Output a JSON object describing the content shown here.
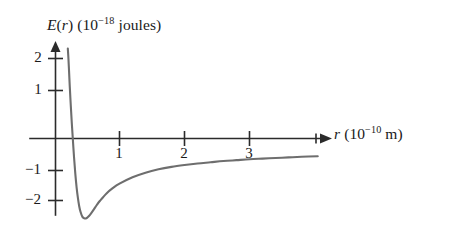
{
  "figure": {
    "kind": "line-plot",
    "background_color": "#ffffff",
    "axis_color": "#2b2b2b",
    "curve_color": "#6e6e6e"
  },
  "labels": {
    "y_axis": {
      "quantity": "E(r)",
      "quantity_base": "E",
      "quantity_arg": "(r)",
      "units_open": "(10",
      "units_exponent": "−18",
      "units_close": " joules)",
      "full_text": "E(r) (10−18 joules)"
    },
    "x_axis": {
      "quantity": "r",
      "units_open": "(10",
      "units_exponent": "−10",
      "units_close": " m)",
      "full_text": "r (10−10 m)"
    }
  },
  "chart_data": {
    "type": "line",
    "title": "",
    "subtitle": "",
    "xlabel": "r (10−10 m)",
    "ylabel": "E(r) (10−18 joules)",
    "xlim": [
      -0.4,
      4.3
    ],
    "ylim": [
      -2.9,
      2.6
    ],
    "grid": false,
    "legend": null,
    "x_ticks": [
      1,
      2,
      3
    ],
    "x_tick_labels": [
      "1",
      "2",
      "3"
    ],
    "y_ticks": [
      2,
      1,
      -1,
      -2
    ],
    "y_tick_labels": [
      "2",
      "1",
      "−1",
      "−2"
    ],
    "x_axis_arrow": true,
    "y_axis_arrow": true,
    "annotations": [
      {
        "text": "minimum of potential well",
        "x": 0.48,
        "y": -2.62
      },
      {
        "text": "zero crossing",
        "x": 0.28,
        "y": 0.0
      }
    ],
    "series": [
      {
        "name": "E(r) intermolecular potential",
        "color": "#6e6e6e",
        "x": [
          0.205,
          0.215,
          0.225,
          0.235,
          0.25,
          0.265,
          0.28,
          0.3,
          0.32,
          0.34,
          0.36,
          0.38,
          0.4,
          0.43,
          0.46,
          0.48,
          0.5,
          0.53,
          0.56,
          0.6,
          0.65,
          0.7,
          0.8,
          0.9,
          1.0,
          1.2,
          1.4,
          1.6,
          1.8,
          2.0,
          2.2,
          2.4,
          2.6,
          2.8,
          3.0,
          3.2,
          3.4,
          3.6,
          3.8,
          4.05
        ],
        "y": [
          2.95,
          2.6,
          2.15,
          1.7,
          1.1,
          0.55,
          0.05,
          -0.6,
          -1.15,
          -1.6,
          -1.95,
          -2.22,
          -2.4,
          -2.57,
          -2.62,
          -2.62,
          -2.6,
          -2.54,
          -2.46,
          -2.34,
          -2.18,
          -2.04,
          -1.8,
          -1.62,
          -1.48,
          -1.27,
          -1.12,
          -1.01,
          -0.93,
          -0.87,
          -0.82,
          -0.78,
          -0.74,
          -0.71,
          -0.68,
          -0.66,
          -0.64,
          -0.62,
          -0.6,
          -0.58
        ]
      }
    ]
  }
}
